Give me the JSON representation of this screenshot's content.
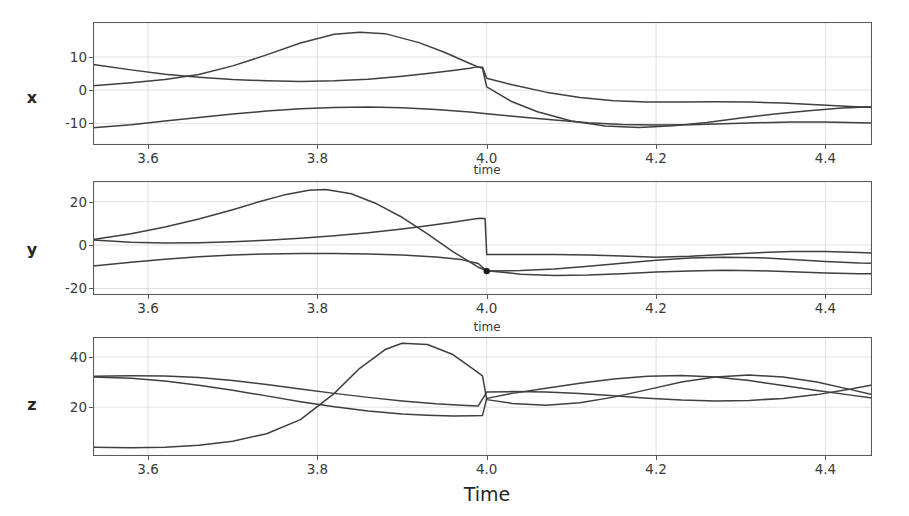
{
  "figure": {
    "xlabel_bottom": "Time",
    "inner_xlabel": "time",
    "background": "#ffffff",
    "line_color": "#3f3f3f",
    "grid_color": "#d9d9d9",
    "axis_color": "#5a5a5a"
  },
  "chart_data": {
    "type": "line",
    "title": "",
    "xlabel": "Time",
    "grid": true,
    "legend": "none",
    "shared_x": true,
    "xlim": [
      3.535,
      4.455
    ],
    "xticks": [
      3.6,
      3.8,
      4.0,
      4.2,
      4.4
    ],
    "xticklabels": [
      "3.6",
      "3.8",
      "4.0",
      "4.2",
      "4.4"
    ],
    "panels": [
      {
        "ylabel": "x",
        "ylim": [
          -16.5,
          20.5
        ],
        "yticks": [
          -10,
          0,
          10
        ],
        "yticklabels": [
          "-10",
          "0",
          "10"
        ],
        "inner_xlabel": "time",
        "markers": [],
        "series": [
          {
            "name": "x-series-1",
            "x": [
              3.535,
              3.58,
              3.62,
              3.66,
              3.7,
              3.74,
              3.78,
              3.82,
              3.85,
              3.88,
              3.92,
              3.95,
              3.98,
              3.99,
              3.995,
              4.0,
              4.03,
              4.06,
              4.1,
              4.14,
              4.18,
              4.22,
              4.26,
              4.3,
              4.34,
              4.38,
              4.42,
              4.455
            ],
            "y": [
              1.3,
              2.2,
              3.2,
              4.7,
              7.3,
              10.6,
              14.2,
              16.8,
              17.4,
              17.0,
              14.3,
              11.4,
              8.0,
              7.0,
              6.6,
              1.0,
              -3.5,
              -6.5,
              -9.3,
              -10.8,
              -11.2,
              -10.7,
              -9.7,
              -8.4,
              -7.2,
              -6.2,
              -5.4,
              -5.0
            ]
          },
          {
            "name": "x-series-2",
            "x": [
              3.535,
              3.58,
              3.62,
              3.66,
              3.7,
              3.74,
              3.78,
              3.82,
              3.86,
              3.9,
              3.93,
              3.96,
              3.98,
              3.988,
              3.995,
              4.0,
              4.03,
              4.07,
              4.11,
              4.15,
              4.19,
              4.23,
              4.27,
              4.31,
              4.35,
              4.39,
              4.43,
              4.455
            ],
            "y": [
              7.7,
              6.1,
              4.8,
              3.9,
              3.2,
              2.8,
              2.6,
              2.8,
              3.3,
              4.2,
              5.0,
              5.9,
              6.6,
              7.0,
              6.9,
              3.6,
              1.6,
              -0.6,
              -2.2,
              -3.2,
              -3.6,
              -3.6,
              -3.5,
              -3.6,
              -3.9,
              -4.4,
              -4.9,
              -5.2
            ]
          },
          {
            "name": "x-series-3",
            "x": [
              3.535,
              3.58,
              3.62,
              3.66,
              3.7,
              3.74,
              3.78,
              3.82,
              3.86,
              3.9,
              3.94,
              3.98,
              4.0,
              4.04,
              4.08,
              4.12,
              4.16,
              4.2,
              4.24,
              4.28,
              4.32,
              4.36,
              4.4,
              4.44,
              4.455
            ],
            "y": [
              -11.3,
              -10.4,
              -9.3,
              -8.2,
              -7.2,
              -6.3,
              -5.6,
              -5.2,
              -5.1,
              -5.3,
              -5.8,
              -6.6,
              -7.1,
              -8.1,
              -9.0,
              -9.8,
              -10.3,
              -10.5,
              -10.4,
              -10.1,
              -9.8,
              -9.6,
              -9.6,
              -9.8,
              -9.9
            ]
          }
        ]
      },
      {
        "ylabel": "y",
        "ylim": [
          -23.0,
          29.5
        ],
        "yticks": [
          -20,
          0,
          20
        ],
        "yticklabels": [
          "-20",
          "0",
          "20"
        ],
        "inner_xlabel": "time",
        "markers": [
          {
            "x": 4.0,
            "y": -12.0
          }
        ],
        "series": [
          {
            "name": "y-series-1",
            "x": [
              3.535,
              3.58,
              3.62,
              3.66,
              3.7,
              3.73,
              3.76,
              3.79,
              3.81,
              3.84,
              3.87,
              3.9,
              3.93,
              3.96,
              3.99,
              4.0,
              4.04,
              4.08,
              4.12,
              4.16,
              4.2,
              4.24,
              4.28,
              4.32,
              4.36,
              4.4,
              4.44,
              4.455
            ],
            "y": [
              2.6,
              5.2,
              8.3,
              12.0,
              16.3,
              19.8,
              23.0,
              25.2,
              25.6,
              23.6,
              19.0,
              12.8,
              5.2,
              -3.0,
              -10.2,
              -11.8,
              -13.4,
              -14.0,
              -13.8,
              -13.2,
              -12.4,
              -11.9,
              -11.6,
              -11.8,
              -12.3,
              -12.9,
              -13.2,
              -13.2
            ]
          },
          {
            "name": "y-series-2",
            "x": [
              3.535,
              3.58,
              3.62,
              3.66,
              3.7,
              3.74,
              3.78,
              3.82,
              3.86,
              3.9,
              3.93,
              3.96,
              3.985,
              3.992,
              3.998,
              4.0,
              4.04,
              4.08,
              4.12,
              4.16,
              4.2,
              4.24,
              4.28,
              4.32,
              4.36,
              4.4,
              4.44,
              4.455
            ],
            "y": [
              2.3,
              1.3,
              1.0,
              1.1,
              1.5,
              2.2,
              3.1,
              4.3,
              5.7,
              7.4,
              8.9,
              10.5,
              12.0,
              12.3,
              12.2,
              -4.4,
              -4.4,
              -4.4,
              -4.6,
              -5.0,
              -5.6,
              -5.2,
              -4.3,
              -3.5,
              -3.0,
              -3.0,
              -3.4,
              -3.7
            ]
          },
          {
            "name": "y-series-3",
            "x": [
              3.535,
              3.58,
              3.62,
              3.66,
              3.7,
              3.74,
              3.78,
              3.82,
              3.86,
              3.9,
              3.94,
              3.97,
              3.99,
              4.0,
              4.04,
              4.08,
              4.12,
              4.16,
              4.2,
              4.24,
              4.28,
              4.32,
              4.36,
              4.4,
              4.44,
              4.455
            ],
            "y": [
              -9.6,
              -7.9,
              -6.5,
              -5.4,
              -4.6,
              -4.1,
              -3.9,
              -3.9,
              -4.1,
              -4.6,
              -5.5,
              -6.7,
              -8.5,
              -12.0,
              -11.7,
              -11.0,
              -9.8,
              -8.4,
              -7.0,
              -6.0,
              -5.6,
              -5.8,
              -6.6,
              -7.6,
              -8.3,
              -8.4
            ]
          }
        ]
      },
      {
        "ylabel": "z",
        "ylim": [
          0.5,
          48.0
        ],
        "yticks": [
          20,
          40
        ],
        "yticklabels": [
          "20",
          "40"
        ],
        "inner_xlabel": "",
        "markers": [],
        "series": [
          {
            "name": "z-series-1",
            "x": [
              3.535,
              3.58,
              3.62,
              3.66,
              3.7,
              3.74,
              3.78,
              3.82,
              3.85,
              3.88,
              3.9,
              3.93,
              3.96,
              3.985,
              3.995,
              4.0,
              4.03,
              4.07,
              4.11,
              4.15,
              4.19,
              4.23,
              4.27,
              4.31,
              4.35,
              4.39,
              4.43,
              4.455
            ],
            "y": [
              4.0,
              3.8,
              4.0,
              4.8,
              6.4,
              9.4,
              15.0,
              25.5,
              35.5,
              43.0,
              45.5,
              45.0,
              41.0,
              35.0,
              32.5,
              23.0,
              21.5,
              20.8,
              21.8,
              24.0,
              27.0,
              30.0,
              32.0,
              32.8,
              32.0,
              30.0,
              27.0,
              25.0
            ]
          },
          {
            "name": "z-series-2",
            "x": [
              3.535,
              3.58,
              3.62,
              3.66,
              3.7,
              3.74,
              3.78,
              3.82,
              3.86,
              3.9,
              3.93,
              3.96,
              3.985,
              3.995,
              4.0,
              4.03,
              4.07,
              4.11,
              4.15,
              4.19,
              4.23,
              4.27,
              4.31,
              4.35,
              4.39,
              4.43,
              4.455
            ],
            "y": [
              32.0,
              31.5,
              30.4,
              28.7,
              26.7,
              24.5,
              22.2,
              20.2,
              18.5,
              17.3,
              16.8,
              16.5,
              16.6,
              16.7,
              23.5,
              25.5,
              27.5,
              29.5,
              31.2,
              32.3,
              32.6,
              32.0,
              30.6,
              28.6,
              26.6,
              24.8,
              23.6
            ]
          },
          {
            "name": "z-series-3",
            "x": [
              3.535,
              3.58,
              3.62,
              3.66,
              3.7,
              3.74,
              3.78,
              3.82,
              3.86,
              3.9,
              3.94,
              3.97,
              3.99,
              4.0,
              4.03,
              4.07,
              4.11,
              4.15,
              4.19,
              4.23,
              4.27,
              4.31,
              4.35,
              4.39,
              4.43,
              4.455
            ],
            "y": [
              32.3,
              32.5,
              32.4,
              31.8,
              30.6,
              29.0,
              27.2,
              25.5,
              23.9,
              22.5,
              21.4,
              20.8,
              20.5,
              26.0,
              26.2,
              26.0,
              25.4,
              24.5,
              23.6,
              22.9,
              22.5,
              22.7,
              23.5,
              25.0,
              27.2,
              28.8
            ]
          }
        ]
      }
    ]
  }
}
